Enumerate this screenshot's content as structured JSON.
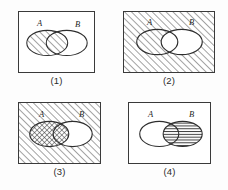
{
  "figure": {
    "title": "",
    "type": "venn-diagram-set",
    "panel_count": 4,
    "colors": {
      "ink": "#3a3a3a",
      "hatch": "#4a4a4a",
      "background": "#ffffff",
      "label": "#1f1f1f"
    },
    "set_labels": {
      "a": "A",
      "b": "B"
    }
  },
  "panels": [
    {
      "caption": "(1)",
      "label_a": "A",
      "label_b": "B",
      "universe_fill": "white",
      "a_fill": "diagonal-hatch",
      "b_fill": "white",
      "lens_fill": "diagonal-hatch",
      "shaded_region": "A"
    },
    {
      "caption": "(2)",
      "label_a": "A",
      "label_b": "B",
      "universe_fill": "diagonal-hatch",
      "a_fill": "diagonal-hatch",
      "b_fill": "white",
      "lens_fill": "white",
      "shaded_region": "complement of B"
    },
    {
      "caption": "(3)",
      "label_a": "A",
      "label_b": "B",
      "universe_fill": "diagonal-hatch",
      "a_fill": "cross-hatch",
      "b_fill": "white",
      "lens_fill": "cross-hatch",
      "shaded_region": "complement of B with A emphasized"
    },
    {
      "caption": "(4)",
      "label_a": "A",
      "label_b": "B",
      "universe_fill": "white",
      "a_fill": "white",
      "b_fill": "horizontal-lines",
      "lens_fill": "horizontal-lines",
      "shaded_region": "B"
    }
  ]
}
